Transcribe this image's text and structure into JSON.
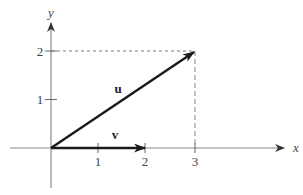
{
  "diagram": {
    "type": "vector-diagram",
    "axes": {
      "x_label": "x",
      "y_label": "y",
      "x_ticks": [
        "1",
        "2",
        "3"
      ],
      "y_ticks": [
        "1",
        "2"
      ]
    },
    "vectors": [
      {
        "name": "u",
        "label": "u",
        "from": [
          0,
          0
        ],
        "to": [
          3,
          2
        ]
      },
      {
        "name": "v",
        "label": "v",
        "from": [
          0,
          0
        ],
        "to": [
          2,
          0
        ]
      }
    ],
    "guides": [
      {
        "name": "horizontal-dashed-to-y2",
        "from": [
          0,
          2
        ],
        "to": [
          3,
          2
        ]
      },
      {
        "name": "vertical-dashed-to-x3",
        "from": [
          3,
          0
        ],
        "to": [
          3,
          2
        ]
      }
    ],
    "colors": {
      "axis": "#8a8a8a",
      "vector": "#1a1a1a",
      "guide": "#777777",
      "text": "#444444"
    }
  }
}
